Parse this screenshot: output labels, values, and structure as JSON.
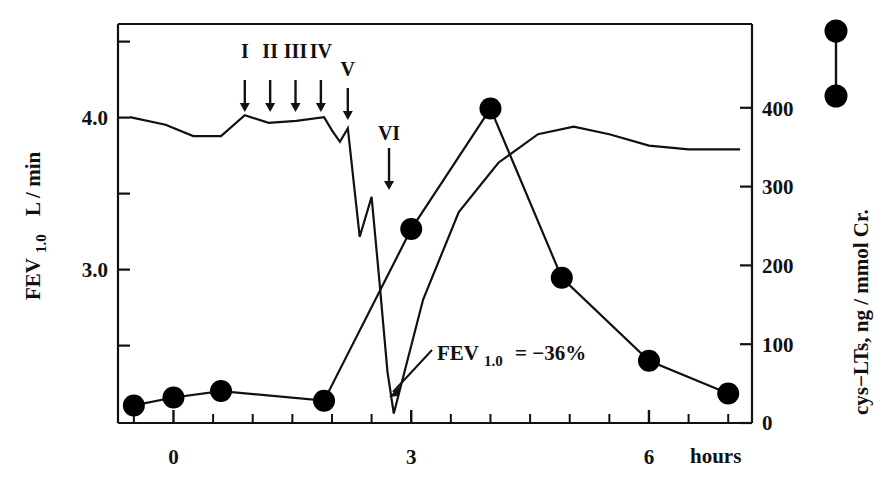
{
  "chart_data": {
    "type": "line",
    "title": "",
    "xlabel": "hours",
    "xlim": [
      -0.7,
      7.3
    ],
    "x_ticks_major": [
      0,
      3,
      6
    ],
    "x_tick_labels": [
      "0",
      "3",
      "6"
    ],
    "x_minor_step": 0.5,
    "grid": false,
    "legend_position": "right-outside-top",
    "left_axis": {
      "label_main": "FEV",
      "label_sub": "1.0",
      "label_unit": "L / min",
      "ylim": [
        2.45,
        4.55
      ],
      "ticks": [
        2.5,
        3.0,
        3.5,
        4.0,
        4.5
      ],
      "tick_labels": [
        "",
        "3.0",
        "",
        "4.0",
        ""
      ]
    },
    "right_axis": {
      "label": "cys−LTs, ng / mmol Cr.",
      "ylim": [
        0,
        500
      ],
      "ticks": [
        0,
        100,
        200,
        300,
        400
      ],
      "tick_labels": [
        "0",
        "100",
        "200",
        "300",
        "400"
      ]
    },
    "series": [
      {
        "name": "FEV 1.0",
        "axis": "left",
        "marker": "none",
        "x": [
          -0.55,
          -0.1,
          0.25,
          0.6,
          0.9,
          1.2,
          1.55,
          1.9,
          2.0,
          2.1,
          2.2,
          2.35,
          2.5,
          2.6,
          2.7,
          2.78,
          3.15,
          3.6,
          4.1,
          4.6,
          5.05,
          5.5,
          6.0,
          6.5,
          7.15
        ],
        "y": [
          4.06,
          4.02,
          3.96,
          3.96,
          4.07,
          4.03,
          4.04,
          4.06,
          3.99,
          3.93,
          4.0,
          3.43,
          3.64,
          3.19,
          2.72,
          2.5,
          3.1,
          3.56,
          3.82,
          3.97,
          4.01,
          3.97,
          3.91,
          3.89,
          3.89
        ]
      },
      {
        "name": "cys-LTs",
        "axis": "right",
        "marker": "filled-circle",
        "x": [
          -0.5,
          0.0,
          0.6,
          1.9,
          3.0,
          4.0,
          4.9,
          6.0,
          7.0
        ],
        "y": [
          22,
          32,
          40,
          28,
          243,
          394,
          182,
          78,
          37
        ]
      }
    ],
    "stimulus_arrows": [
      {
        "label": "I",
        "x": 0.9
      },
      {
        "label": "II",
        "x": 1.22
      },
      {
        "label": "III",
        "x": 1.54
      },
      {
        "label": "IV",
        "x": 1.86
      },
      {
        "label": "V",
        "x": 2.2
      },
      {
        "label": "VI",
        "x": 2.72
      }
    ],
    "annotations": [
      {
        "name": "fev-drop-annotation",
        "text_main": "FEV",
        "text_sub": "1.0",
        "text_tail": "= −36%",
        "points_to_x": 2.78,
        "points_to_y_left": 2.5
      }
    ],
    "legend": {
      "marker_top": "filled-circle",
      "marker_bottom": "filled-circle",
      "connector": "line"
    },
    "colors": {
      "ink": "#111111",
      "background": "#ffffff",
      "marker_fill": "#000000"
    }
  }
}
